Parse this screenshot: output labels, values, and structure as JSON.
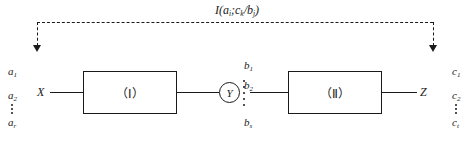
{
  "figure": {
    "mutual_information_label": {
      "prefix": "I(a",
      "sub1": "i",
      "mid": ";c",
      "sub2": "k",
      "divider": "/b",
      "sub3": "j",
      "suffix": ")"
    },
    "input_terminal": "X",
    "output_terminal": "Z",
    "middle_node": "Y",
    "blocks": [
      {
        "name": "block-one",
        "label": "（Ⅰ）"
      },
      {
        "name": "block-two",
        "label": "（Ⅱ）"
      }
    ],
    "input_alphabet": {
      "name": "a",
      "items": [
        {
          "base": "a",
          "sub": "1"
        },
        {
          "base": "a",
          "sub": "2"
        }
      ],
      "last": {
        "base": "a",
        "sub": "r"
      }
    },
    "middle_alphabet": {
      "name": "b",
      "items": [
        {
          "base": "b",
          "sub": "1"
        },
        {
          "base": "b",
          "sub": "2"
        }
      ],
      "last": {
        "base": "b",
        "sub": "s"
      }
    },
    "output_alphabet": {
      "name": "c",
      "items": [
        {
          "base": "c",
          "sub": "1"
        },
        {
          "base": "c",
          "sub": "2"
        }
      ],
      "last": {
        "base": "c",
        "sub": "t"
      }
    },
    "colors": {
      "stroke": "#1a1a1a",
      "background": "#ffffff"
    }
  }
}
